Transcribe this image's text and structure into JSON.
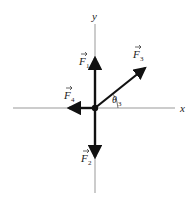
{
  "diagram": {
    "type": "force-vector-diagram",
    "axes": {
      "x_label": "x",
      "y_label": "y",
      "origin": [
        95,
        108
      ],
      "color": "#888888"
    },
    "vectors": [
      {
        "name": "F",
        "subscript": "1",
        "direction": "up",
        "tip": [
          95,
          55
        ]
      },
      {
        "name": "F",
        "subscript": "2",
        "direction": "down",
        "tip": [
          95,
          160
        ]
      },
      {
        "name": "F",
        "subscript": "3",
        "direction": "up-right",
        "tip": [
          147,
          67
        ]
      },
      {
        "name": "F",
        "subscript": "4",
        "direction": "left",
        "tip": [
          66,
          108
        ]
      }
    ],
    "angle": {
      "symbol": "θ",
      "subscript": "3",
      "between": "F3 and +x axis"
    },
    "vector_color": "#111111"
  }
}
